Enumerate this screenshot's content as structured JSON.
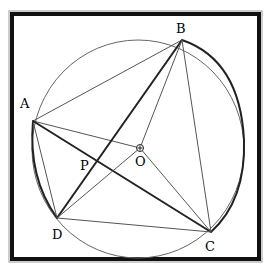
{
  "diagram": {
    "type": "circle-geometry",
    "circle": {
      "center_label": "O"
    },
    "points": [
      {
        "label": "A",
        "role": "vertex"
      },
      {
        "label": "B",
        "role": "vertex"
      },
      {
        "label": "C",
        "role": "vertex"
      },
      {
        "label": "D",
        "role": "vertex"
      },
      {
        "label": "O",
        "role": "center"
      },
      {
        "label": "P",
        "role": "intersection"
      }
    ],
    "segments": [
      "AB",
      "AC",
      "AD",
      "AO",
      "BD",
      "BO",
      "BC",
      "DO",
      "DC",
      "OC"
    ],
    "emphasized": [
      "AC",
      "BD",
      "arc AD",
      "arc BC"
    ],
    "labels": {
      "A": "A",
      "B": "B",
      "C": "C",
      "D": "D",
      "O": "O",
      "P": "P"
    }
  }
}
